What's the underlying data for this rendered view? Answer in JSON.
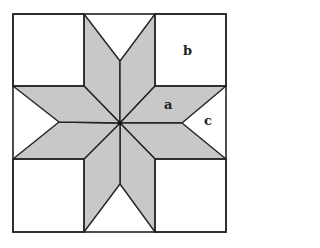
{
  "diagram": {
    "title": "",
    "colors": {
      "fill": "#c8c8c8",
      "stroke": "#222222",
      "background": "#ffffff"
    },
    "labels": [
      {
        "id": "a",
        "text": "a",
        "x": 164,
        "y": 98
      },
      {
        "id": "b",
        "text": "b",
        "x": 183,
        "y": 45
      },
      {
        "id": "c",
        "text": "c",
        "x": 204,
        "y": 115
      }
    ],
    "geometry": {
      "outer": {
        "x1": 13,
        "y1": 14,
        "x2": 226,
        "y2": 232
      },
      "grid_x": [
        13,
        84,
        120,
        155,
        226
      ],
      "grid_y": [
        14,
        86,
        123,
        159,
        232
      ],
      "center": [
        120,
        123
      ],
      "notches": {
        "top": [
          120,
          61
        ],
        "bottom": [
          120,
          184
        ],
        "left": [
          59,
          122
        ],
        "right": [
          182,
          123
        ]
      }
    }
  }
}
